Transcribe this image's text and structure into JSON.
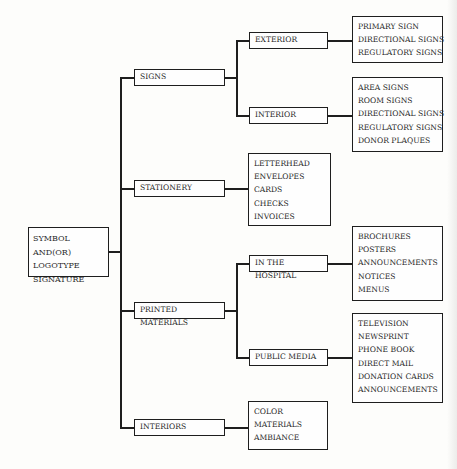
{
  "diagram": {
    "root": {
      "lines": [
        "SYMBOL AND(OR)",
        "LOGOTYPE",
        "SIGNATURE"
      ]
    },
    "categories": [
      {
        "label": "SIGNS",
        "subcategories": [
          {
            "label": "EXTERIOR",
            "items": [
              "PRIMARY SIGN",
              "DIRECTIONAL SIGNS",
              "REGULATORY SIGNS"
            ]
          },
          {
            "label": "INTERIOR",
            "items": [
              "AREA SIGNS",
              "ROOM SIGNS",
              "DIRECTIONAL SIGNS",
              "REGULATORY SIGNS",
              "DONOR PLAQUES"
            ]
          }
        ]
      },
      {
        "label": "STATIONERY",
        "items": [
          "LETTERHEAD",
          "ENVELOPES",
          "CARDS",
          "CHECKS",
          "INVOICES"
        ]
      },
      {
        "label": "PRINTED MATERIALS",
        "subcategories": [
          {
            "label": "IN THE HOSPITAL",
            "items": [
              "BROCHURES",
              "POSTERS",
              "ANNOUNCEMENTS",
              "NOTICES",
              "MENUS"
            ]
          },
          {
            "label": "PUBLIC MEDIA",
            "items": [
              "TELEVISION",
              "NEWSPRINT",
              "PHONE BOOK",
              "DIRECT MAIL",
              "DONATION CARDS",
              "ANNOUNCEMENTS"
            ]
          }
        ]
      },
      {
        "label": "INTERIORS",
        "items": [
          "COLOR",
          "MATERIALS",
          "AMBIANCE"
        ]
      }
    ]
  }
}
